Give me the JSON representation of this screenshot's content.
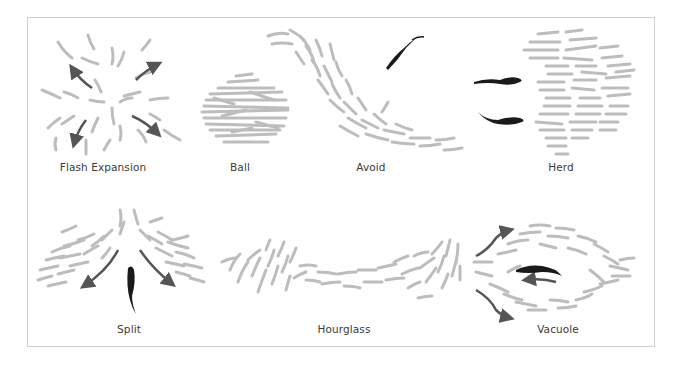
{
  "diagram": {
    "title": "",
    "colors": {
      "prey_fish": "#bdbdbd",
      "arrow": "#555555",
      "predator": "#1a1a1a",
      "frame_border": "#cfcfcf",
      "label_text": "#3a3a3a"
    },
    "panels": [
      {
        "id": "flash-expansion",
        "label": "Flash Expansion",
        "row": 1,
        "label_x": 103,
        "label_y": 168
      },
      {
        "id": "ball",
        "label": "Ball",
        "row": 1,
        "label_x": 240,
        "label_y": 168
      },
      {
        "id": "avoid",
        "label": "Avoid",
        "row": 1,
        "label_x": 371,
        "label_y": 168
      },
      {
        "id": "herd",
        "label": "Herd",
        "row": 1,
        "label_x": 561,
        "label_y": 168
      },
      {
        "id": "split",
        "label": "Split",
        "row": 2,
        "label_x": 129,
        "label_y": 330
      },
      {
        "id": "hourglass",
        "label": "Hourglass",
        "row": 2,
        "label_x": 344,
        "label_y": 330
      },
      {
        "id": "vacuole",
        "label": "Vacuole",
        "row": 2,
        "label_x": 558,
        "label_y": 330
      }
    ]
  }
}
